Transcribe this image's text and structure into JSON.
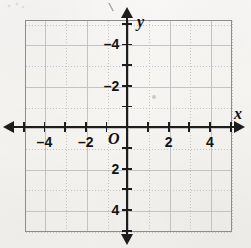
{
  "figure": {
    "kind": "coordinate-plane",
    "origin_label": "O",
    "x_axis_label": "x",
    "y_axis_label": "y"
  },
  "chart_data": {
    "type": "scatter",
    "title": "",
    "subtitle": "",
    "xlabel": "x",
    "ylabel": "y",
    "origin_label": "O",
    "xlim": [
      -5,
      5
    ],
    "ylim": [
      -5,
      5
    ],
    "x_tick_step": 1,
    "y_tick_step": 1,
    "x_labeled_ticks": [
      -4,
      -2,
      2,
      4
    ],
    "y_labeled_ticks": [
      -4,
      -2,
      2,
      4
    ],
    "x_tick_label_text": [
      "–4",
      "–2",
      "2",
      "4"
    ],
    "y_tick_label_text": [
      "4",
      "2",
      "–2",
      "–4"
    ],
    "grid": true,
    "grid_major_step": 2,
    "grid_minor_step": 1,
    "grid_major_style": "solid",
    "grid_minor_style": "dotted",
    "axis_arrows": [
      "left",
      "right",
      "up",
      "down"
    ],
    "legend": null,
    "series": [],
    "points": [],
    "annotations": []
  },
  "colors": {
    "paper": "#f7f6f4",
    "axis": "#1d1d1d",
    "plot_border": "#8d8d8d",
    "grid_major": "#c3c3c3",
    "grid_minor": "#b9b9b9",
    "label_text": "#141414"
  }
}
